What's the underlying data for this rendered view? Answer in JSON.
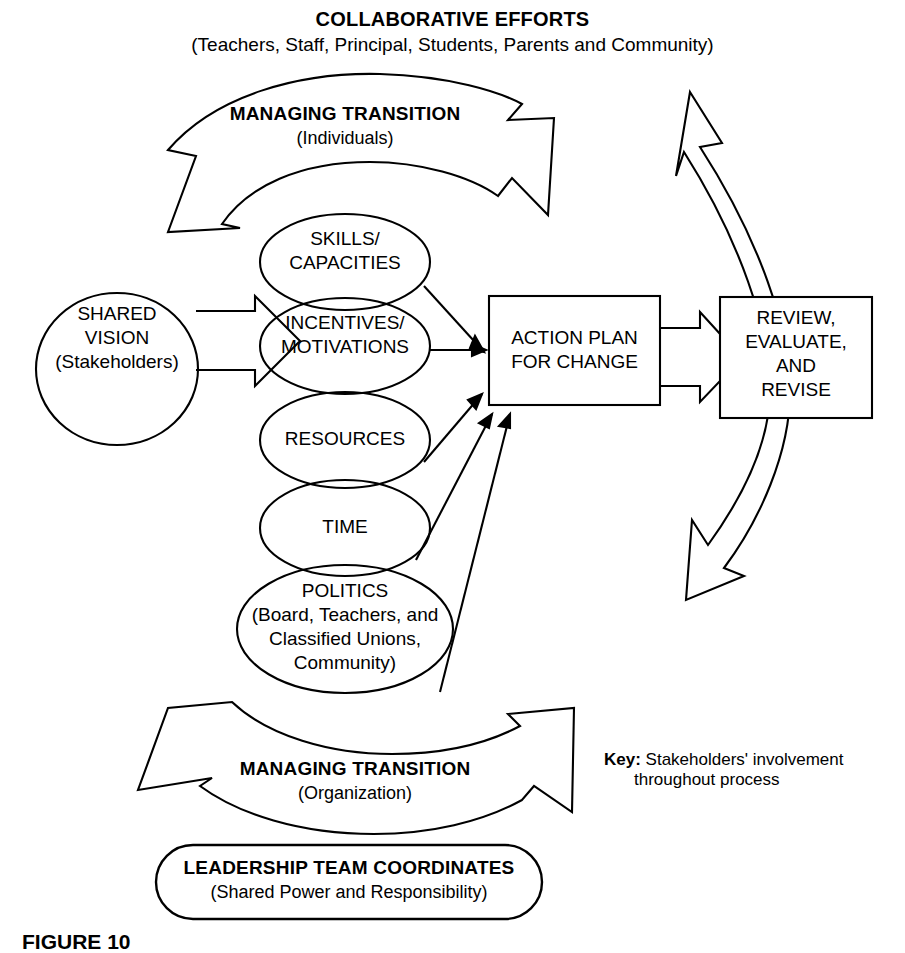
{
  "figure": {
    "header_title": "COLLABORATIVE EFFORTS",
    "header_subtitle": "(Teachers, Staff, Principal, Students, Parents and Community)",
    "caption": "FIGURE 10"
  },
  "top_arrow": {
    "title": "MANAGING TRANSITION",
    "subtitle": "(Individuals)",
    "icon": "curved-arrow-right-icon"
  },
  "bottom_arrow": {
    "title": "MANAGING TRANSITION",
    "subtitle": "(Organization)",
    "icon": "curved-arrow-right-icon"
  },
  "shared_vision": {
    "line1": "SHARED",
    "line2": "VISION",
    "line3": "(Stakeholders)"
  },
  "factors": [
    {
      "id": "skills",
      "line1": "SKILLS/",
      "line2": "CAPACITIES",
      "line3": "",
      "line4": ""
    },
    {
      "id": "incentives",
      "line1": "INCENTIVES/",
      "line2": "MOTIVATIONS",
      "line3": "",
      "line4": ""
    },
    {
      "id": "resources",
      "line1": "RESOURCES",
      "line2": "",
      "line3": "",
      "line4": ""
    },
    {
      "id": "time",
      "line1": "TIME",
      "line2": "",
      "line3": "",
      "line4": ""
    },
    {
      "id": "politics",
      "line1": "POLITICS",
      "line2": "(Board, Teachers, and",
      "line3": "Classified Unions,",
      "line4": "Community)"
    }
  ],
  "action_plan": {
    "line1": "ACTION PLAN",
    "line2": "FOR CHANGE"
  },
  "review": {
    "line1": "REVIEW,",
    "line2": "EVALUATE,",
    "line3": "AND",
    "line4": "REVISE"
  },
  "leadership": {
    "title": "LEADERSHIP TEAM COORDINATES",
    "subtitle": "(Shared Power and Responsibility)"
  },
  "key": {
    "label": "Key:",
    "line1": "Stakeholders' involvement",
    "line2": "throughout process"
  },
  "colors": {
    "stroke": "#000000",
    "fill": "#ffffff",
    "background": "#ffffff"
  }
}
